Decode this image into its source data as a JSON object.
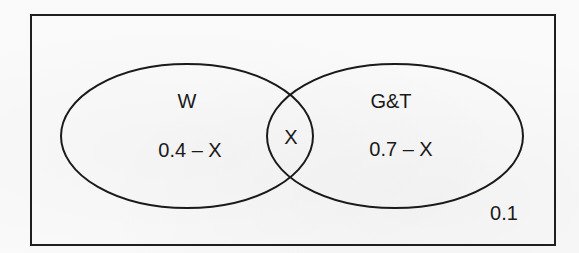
{
  "diagram": {
    "type": "venn",
    "universe": {
      "label": "0.1",
      "x": 31,
      "y": 15,
      "width": 524,
      "height": 230
    },
    "sets": [
      {
        "name": "W",
        "only_value": "0.4 – X",
        "cx": 187,
        "cy": 136,
        "rx": 126,
        "ry": 72
      },
      {
        "name": "G&T",
        "only_value": "0.7 – X",
        "cx": 395,
        "cy": 136,
        "rx": 128,
        "ry": 72
      }
    ],
    "intersection": {
      "label": "X"
    },
    "colors": {
      "stroke": "#1a1a1a",
      "background": "#fafafa",
      "text": "#1a1a1a"
    }
  }
}
